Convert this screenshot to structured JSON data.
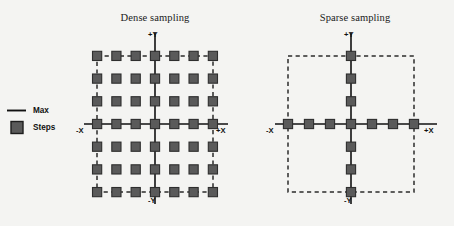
{
  "figure": {
    "background_color": "#f4f4f2",
    "width": 454,
    "height": 226
  },
  "legend": {
    "items": [
      {
        "symbol": "line",
        "label": "Max",
        "color": "#111111"
      },
      {
        "symbol": "square",
        "label": "Steps",
        "color": "#5a5a5a"
      }
    ]
  },
  "panels": [
    {
      "id": "dense",
      "title": "Dense sampling",
      "axis_labels": {
        "pos_y": "+Y",
        "neg_y": "-Y",
        "neg_x": "-X",
        "pos_x": "+X"
      },
      "sampling_pattern": "full-grid",
      "grid_cols": 7,
      "grid_rows": 7,
      "step_count": 49,
      "boundary": "dashed-perimeter"
    },
    {
      "id": "sparse",
      "title": "Sparse sampling",
      "axis_labels": {
        "pos_y": "+Y",
        "neg_y": "-Y",
        "neg_x": "-X",
        "pos_x": "+X"
      },
      "sampling_pattern": "axes-only",
      "grid_cols": 7,
      "grid_rows": 7,
      "step_count": 13,
      "boundary": "dashed-rectangle"
    }
  ],
  "chart_data": {
    "type": "scatter",
    "title": "",
    "xlabel": "X",
    "ylabel": "Y",
    "grid": false,
    "legend_position": "left",
    "axis_ticks": [
      -3,
      -2,
      -1,
      0,
      1,
      2,
      3
    ],
    "series": [
      {
        "name": "Dense sampling",
        "panel": "dense",
        "marker": "square",
        "color": "#5a5a5a",
        "points_x": [
          -3,
          -2,
          -1,
          0,
          1,
          2,
          3,
          -3,
          -2,
          -1,
          0,
          1,
          2,
          3,
          -3,
          -2,
          -1,
          0,
          1,
          2,
          3,
          -3,
          -2,
          -1,
          0,
          1,
          2,
          3,
          -3,
          -2,
          -1,
          0,
          1,
          2,
          3,
          -3,
          -2,
          -1,
          0,
          1,
          2,
          3,
          -3,
          -2,
          -1,
          0,
          1,
          2,
          3
        ],
        "points_y": [
          3,
          3,
          3,
          3,
          3,
          3,
          3,
          2,
          2,
          2,
          2,
          2,
          2,
          2,
          1,
          1,
          1,
          1,
          1,
          1,
          1,
          0,
          0,
          0,
          0,
          0,
          0,
          0,
          -1,
          -1,
          -1,
          -1,
          -1,
          -1,
          -1,
          -2,
          -2,
          -2,
          -2,
          -2,
          -2,
          -2,
          -3,
          -3,
          -3,
          -3,
          -3,
          -3,
          -3
        ]
      },
      {
        "name": "Sparse sampling",
        "panel": "sparse",
        "marker": "square",
        "color": "#5a5a5a",
        "points_x": [
          -3,
          -2,
          -1,
          0,
          1,
          2,
          3,
          0,
          0,
          0,
          0,
          0,
          0
        ],
        "points_y": [
          0,
          0,
          0,
          0,
          0,
          0,
          0,
          3,
          2,
          1,
          -1,
          -2,
          -3
        ]
      }
    ]
  }
}
